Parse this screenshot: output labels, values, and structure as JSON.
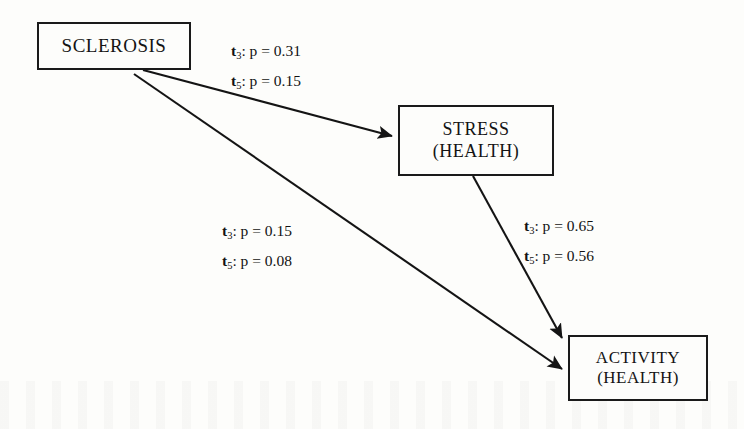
{
  "diagram": {
    "type": "path-diagram",
    "background_color": "#fdfdfb",
    "ink_color": "#141414",
    "nodes": [
      {
        "id": "sclerosis",
        "line1": "SCLEROSIS",
        "line2": ""
      },
      {
        "id": "stress",
        "line1": "STRESS",
        "line2": "(HEALTH)"
      },
      {
        "id": "activity",
        "line1": "ACTIVITY",
        "line2": "(HEALTH)"
      }
    ],
    "edges": [
      {
        "id": "sclerosis-to-stress",
        "from": "SCLEROSIS",
        "to": "STRESS (HEALTH)",
        "label": {
          "row1": {
            "variable": "t",
            "subscript": "3",
            "text": ": p = 0.31"
          },
          "row2": {
            "variable": "t",
            "subscript": "5",
            "text": ": p = 0.15"
          }
        }
      },
      {
        "id": "sclerosis-to-activity",
        "from": "SCLEROSIS",
        "to": "ACTIVITY (HEALTH)",
        "label": {
          "row1": {
            "variable": "t",
            "subscript": "3",
            "text": ": p = 0.15"
          },
          "row2": {
            "variable": "t",
            "subscript": "5",
            "text": ": p = 0.08"
          }
        }
      },
      {
        "id": "stress-to-activity",
        "from": "STRESS (HEALTH)",
        "to": "ACTIVITY (HEALTH)",
        "label": {
          "row1": {
            "variable": "t",
            "subscript": "3",
            "text": ": p = 0.65"
          },
          "row2": {
            "variable": "t",
            "subscript": "5",
            "text": ": p = 0.56"
          }
        }
      }
    ]
  }
}
